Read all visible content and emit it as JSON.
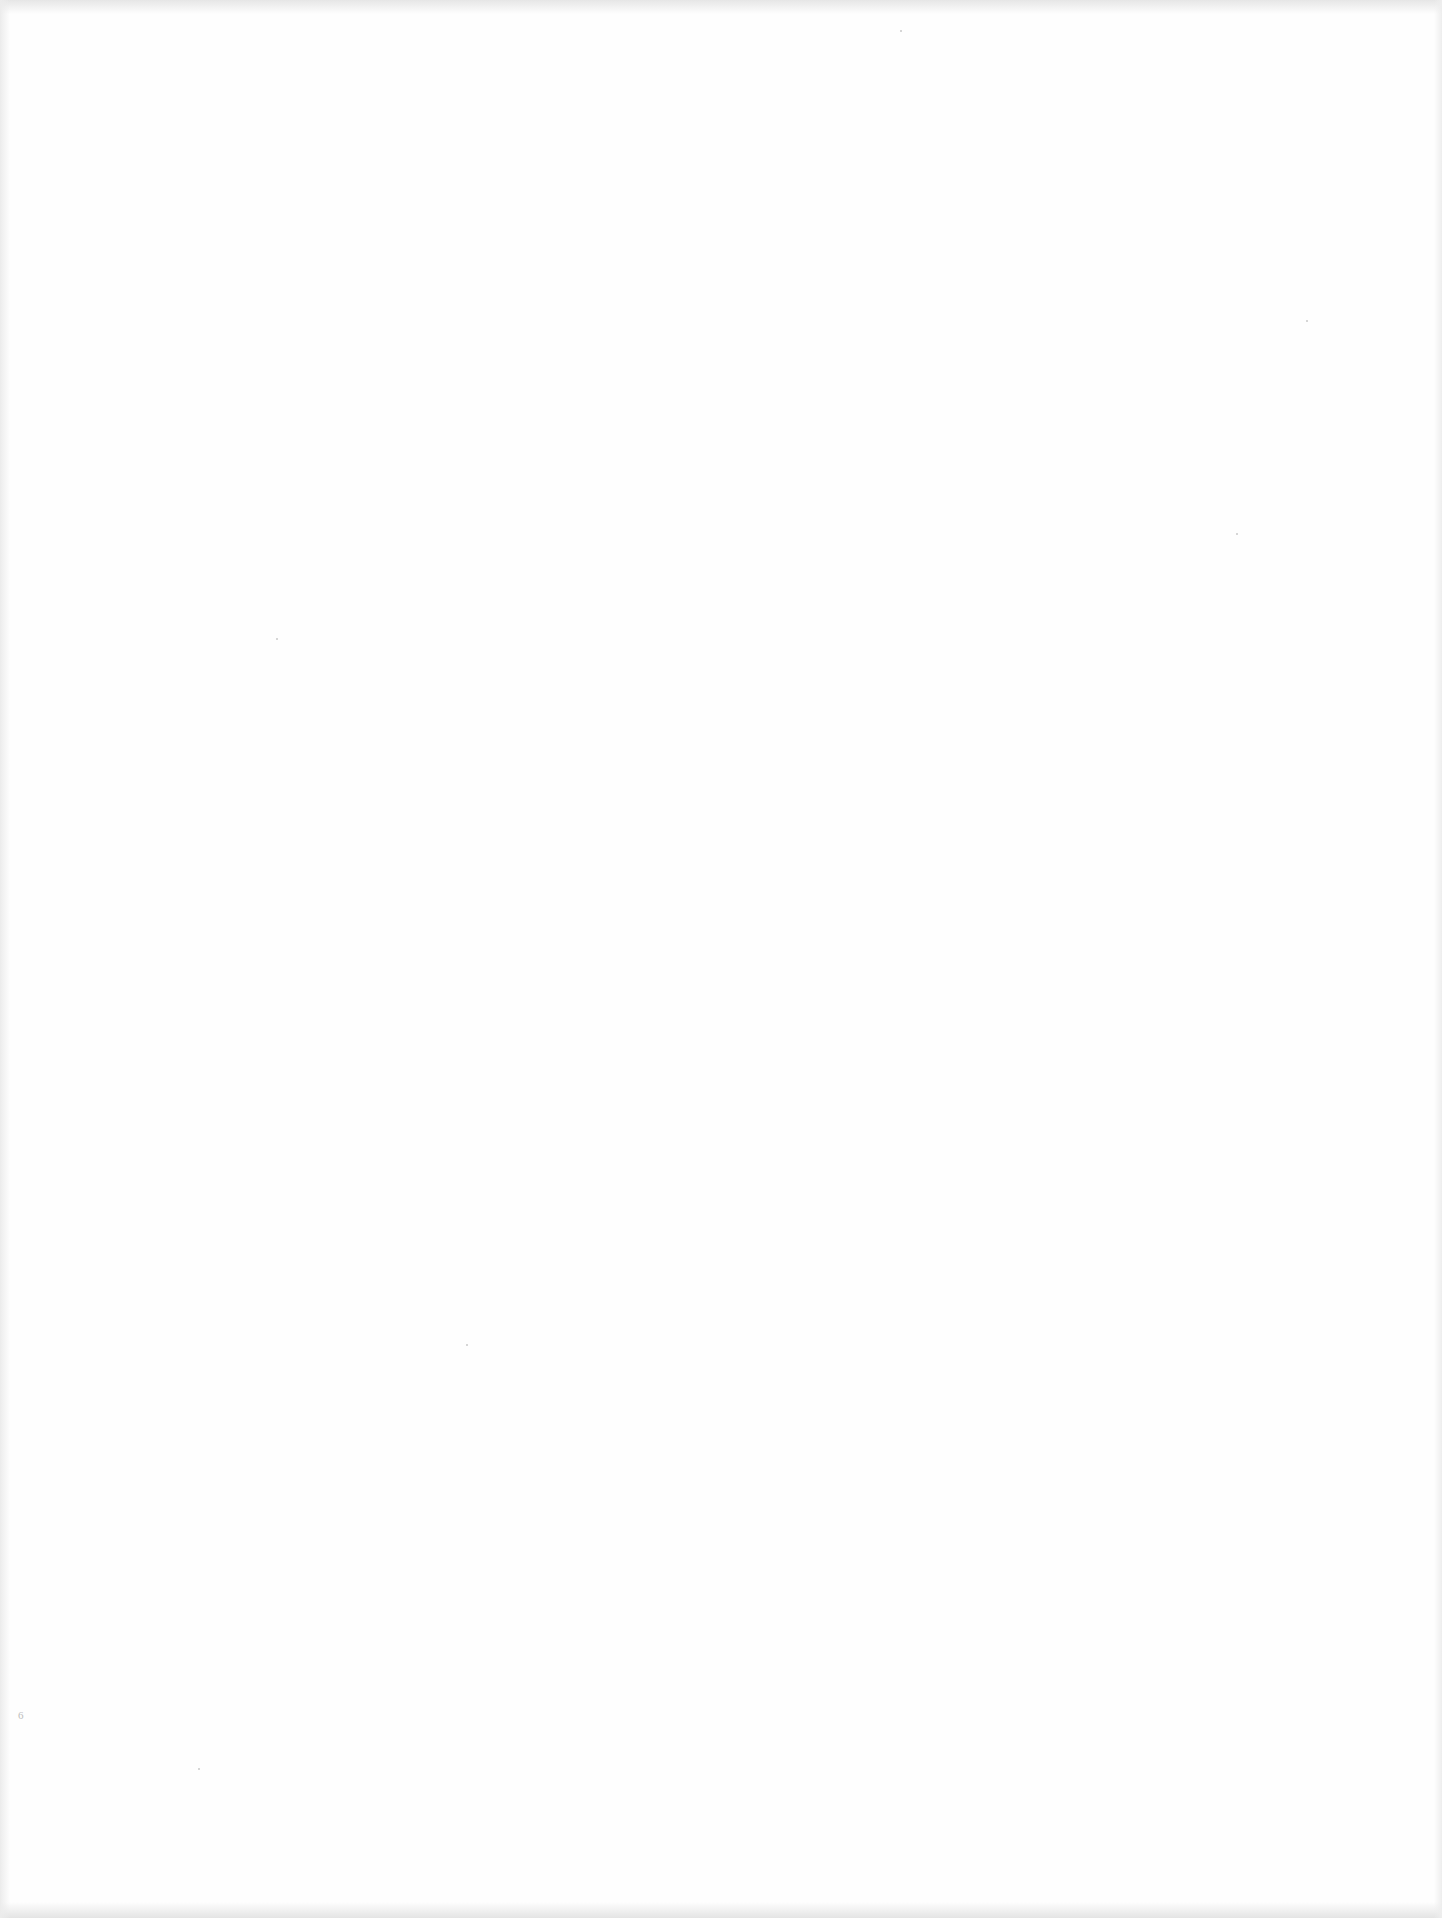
{
  "document": {
    "description": "Blank scanned page",
    "page_number": "6"
  },
  "colors": {
    "paper": "#fefefe",
    "scan_edge": "#e6e6e6",
    "faint_mark": "#bdbdbd"
  }
}
